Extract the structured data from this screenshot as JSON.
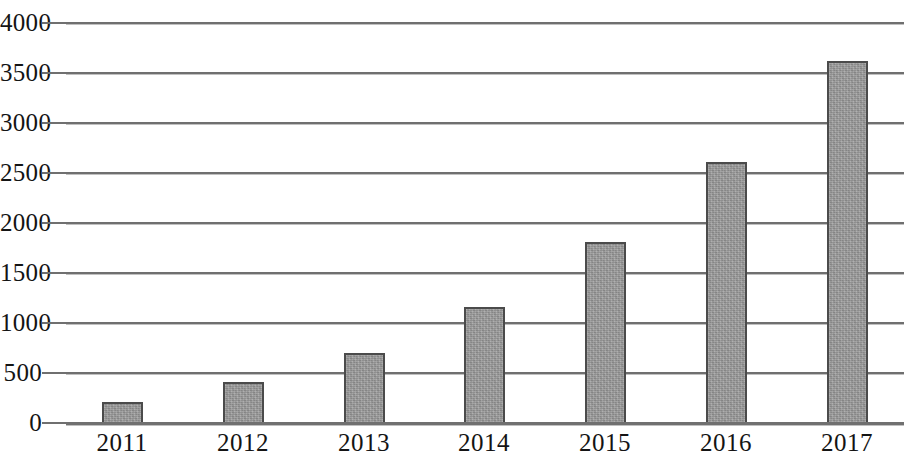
{
  "chart_data": {
    "type": "bar",
    "title": "",
    "subtitle": "",
    "xlabel": "",
    "ylabel": "",
    "categories": [
      "2011",
      "2012",
      "2013",
      "2014",
      "2015",
      "2016",
      "2017"
    ],
    "values": [
      200,
      400,
      690,
      1150,
      1800,
      2600,
      3610
    ],
    "series": [
      {
        "name": "",
        "values": [
          200,
          400,
          690,
          1150,
          1800,
          2600,
          3610
        ]
      }
    ],
    "ylim": [
      0,
      4000
    ],
    "ytick_step": 500,
    "ytick_labels": [
      "0",
      "500",
      "1000",
      "1500",
      "2000",
      "2500",
      "3000",
      "3500",
      "4000"
    ],
    "ytick_values": [
      0,
      500,
      1000,
      1500,
      2000,
      2500,
      3000,
      3500,
      4000
    ],
    "grid": true,
    "grid_axis": "y",
    "legend": false,
    "legend_position": "none",
    "bar_fill_color": "#9b9b9b",
    "bar_border_color": "#4b4b4b",
    "gridline_color": "#6f6f6f",
    "text_color": "#141414",
    "background_color": "#ffffff"
  }
}
